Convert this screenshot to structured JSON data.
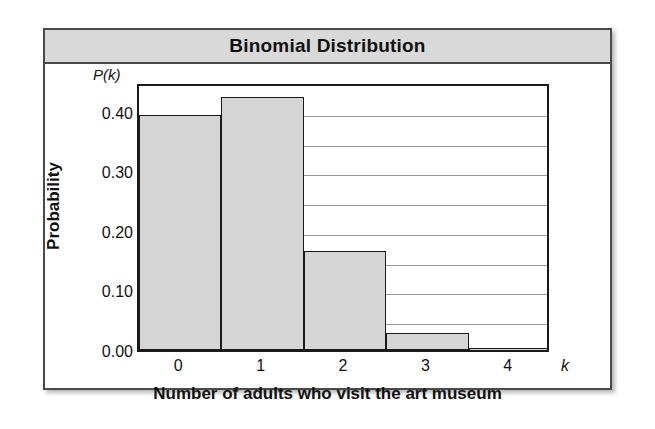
{
  "chart_data": {
    "type": "bar",
    "title": "Binomial Distribution",
    "xlabel": "Number of adults who visit the art museum",
    "ylabel": "Probability",
    "x_axis_symbol": "k",
    "y_axis_symbol": "P(k)",
    "categories": [
      "0",
      "1",
      "2",
      "3",
      "4"
    ],
    "values": [
      0.395,
      0.425,
      0.166,
      0.029,
      0.001
    ],
    "ylim": [
      0.0,
      0.45
    ],
    "xlim": [
      0,
      5
    ],
    "y_tick_labels": [
      "0.00",
      "0.10",
      "0.20",
      "0.30",
      "0.40"
    ],
    "y_tick_values": [
      0.0,
      0.1,
      0.2,
      0.3,
      0.4
    ],
    "gridline_values": [
      0.05,
      0.1,
      0.15,
      0.2,
      0.25,
      0.3,
      0.35,
      0.4
    ],
    "grid": true,
    "legend": "none",
    "bar_fill_color": "#d5d5d5",
    "bar_edge_color": "#1a1a1a",
    "title_bar_color": "#d9d9d9",
    "frame_color": "#4a4a4a"
  }
}
